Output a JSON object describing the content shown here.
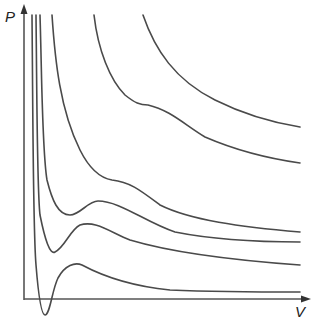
{
  "diagram": {
    "y_axis_label": "P",
    "x_axis_label": "V",
    "axis_color": "#555555",
    "curve_color": "#4a4a4a",
    "isotherms": [
      {
        "name": "isotherm-1",
        "description": "highest temperature, hyperbola-like"
      },
      {
        "name": "isotherm-2",
        "description": "high temperature, slight shoulder"
      },
      {
        "name": "isotherm-3",
        "description": "near-critical, shoulder"
      },
      {
        "name": "isotherm-4",
        "description": "critical isotherm, inflection point"
      },
      {
        "name": "isotherm-5",
        "description": "below critical, small oscillation"
      },
      {
        "name": "isotherm-6",
        "description": "low temperature, deep oscillation below V axis"
      }
    ]
  }
}
